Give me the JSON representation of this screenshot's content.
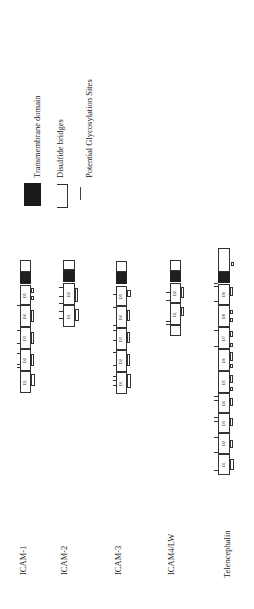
{
  "legend": {
    "transmembrane_label": "Transmembrane domain",
    "disulfide_label": "Disulfide bridges",
    "glycosylation_label": "Potential Glycosylation Sites"
  },
  "proteins": [
    {
      "name": "ICAM-1",
      "domains": [
        "D1",
        "D2",
        "D3",
        "D4",
        "D5"
      ]
    },
    {
      "name": "ICAM-2",
      "domains": [
        "D1",
        "D2"
      ]
    },
    {
      "name": "ICAM-3",
      "domains": [
        "D1",
        "D2",
        "D3",
        "D4",
        "D5"
      ]
    },
    {
      "name": "ICAM4/LW",
      "domains": [
        "D1",
        "D2"
      ]
    },
    {
      "name": "Telencephalin",
      "domains": [
        "D1",
        "D2",
        "D3",
        "D4",
        "D5",
        "D6",
        "D7",
        "D8",
        "D9"
      ]
    }
  ],
  "colors": {
    "transmembrane": "#1e1e1e",
    "outline": "#333333",
    "background": "#ffffff"
  }
}
